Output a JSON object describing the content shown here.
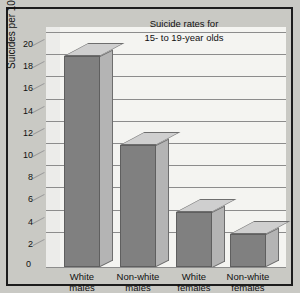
{
  "chart_data": {
    "type": "bar",
    "title": "Suicide rates for 15- to 19-year olds",
    "title_lines": [
      "Suicide rates for",
      "15- to 19-year olds"
    ],
    "categories": [
      "White males",
      "Non-white males",
      "White females",
      "Non-white females"
    ],
    "category_lines": [
      [
        "White",
        "males"
      ],
      [
        "Non-white",
        "males"
      ],
      [
        "White",
        "females"
      ],
      [
        "Non-white",
        "females"
      ]
    ],
    "values": [
      19,
      11,
      5,
      3
    ],
    "xlabel": "",
    "ylabel": "Suicides per 100,000 in population",
    "ylim": [
      0,
      20
    ],
    "ytick_step": 2,
    "ytick_labels": [
      "0",
      "2",
      "4",
      "6",
      "8",
      "10",
      "12",
      "14",
      "16",
      "18",
      "20"
    ],
    "grid": true,
    "legend": "none",
    "style": "3d-bar"
  },
  "colors": {
    "bar_front": "#808080",
    "bar_side": "#b4b4b4",
    "bar_top": "#cfcfcf",
    "plot_background": "#f4f4f1",
    "figure_background": "#c9c9c4",
    "gridline": "#8c8c8c",
    "border": "#1c1c1c",
    "text": "#111111"
  }
}
